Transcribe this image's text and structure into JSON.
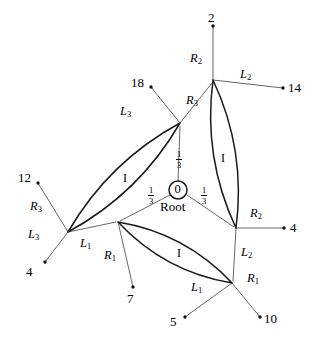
{
  "figure": {
    "type": "graph-diagram",
    "root": {
      "value": "0",
      "label": "Root",
      "cx": 178,
      "cy": 190,
      "r": 9
    },
    "weights": [
      {
        "text_top": "1",
        "text_bottom": "3",
        "x": 176,
        "y": 150,
        "name": "weight-up"
      },
      {
        "text_top": "1",
        "text_bottom": "3",
        "x": 148,
        "y": 186,
        "name": "weight-left"
      },
      {
        "text_top": "1",
        "text_bottom": "3",
        "x": 201,
        "y": 186,
        "name": "weight-right"
      }
    ],
    "nodes": [
      {
        "name": "node-upper-left",
        "x": 180,
        "y": 123
      },
      {
        "name": "node-left",
        "x": 68,
        "y": 232
      },
      {
        "name": "node-right-top",
        "x": 213,
        "y": 80
      },
      {
        "name": "node-right-bottom",
        "x": 236,
        "y": 228
      },
      {
        "name": "node-bottom-left",
        "x": 118,
        "y": 222
      },
      {
        "name": "node-bottom-right",
        "x": 232,
        "y": 283
      }
    ],
    "ellipses": [
      {
        "name": "ellipse-left",
        "x1": 68,
        "y1": 232,
        "x2": 180,
        "y2": 123,
        "bulge": 11,
        "label": "I",
        "label_x": 123,
        "label_y": 172
      },
      {
        "name": "ellipse-right",
        "x1": 213,
        "y1": 80,
        "x2": 236,
        "y2": 228,
        "bulge": 11,
        "label": "I",
        "label_x": 221,
        "label_y": 152
      },
      {
        "name": "ellipse-bottom",
        "x1": 118,
        "y1": 222,
        "x2": 232,
        "y2": 283,
        "bulge": 11,
        "label": "I",
        "label_x": 177,
        "label_y": 247
      }
    ],
    "spokes": [
      {
        "name": "spoke-root-to-upper-left",
        "x1": 178,
        "y1": 181,
        "x2": 180,
        "y2": 126
      },
      {
        "name": "spoke-root-to-bottom-left",
        "x1": 170,
        "y1": 195,
        "x2": 120,
        "y2": 221
      },
      {
        "name": "spoke-root-to-right-bottom",
        "x1": 187,
        "y1": 195,
        "x2": 234,
        "y2": 227
      }
    ],
    "branches": [
      {
        "name": "branch-18",
        "x1": 180,
        "y1": 123,
        "x2": 151,
        "y2": 87,
        "leaf": "18",
        "leaf_x": 131,
        "leaf_y": 76,
        "edge_label": "L",
        "edge_sub": "3",
        "edge_x": 120,
        "edge_y": 105
      },
      {
        "name": "branch-upper-left-to-right-top",
        "x1": 180,
        "y1": 123,
        "x2": 212,
        "y2": 83,
        "edge_label": "R",
        "edge_sub": "3",
        "edge_x": 186,
        "edge_y": 94
      },
      {
        "name": "branch-12",
        "x1": 68,
        "y1": 232,
        "x2": 38,
        "y2": 183,
        "leaf": "12",
        "leaf_x": 18,
        "leaf_y": 171,
        "edge_label": "R",
        "edge_sub": "3",
        "edge_x": 30,
        "edge_y": 200
      },
      {
        "name": "branch-4-left",
        "x1": 68,
        "y1": 232,
        "x2": 45,
        "y2": 262,
        "leaf": "4",
        "leaf_x": 26,
        "leaf_y": 265,
        "edge_label": "L",
        "edge_sub": "3",
        "edge_x": 28,
        "edge_y": 228
      },
      {
        "name": "branch-2",
        "x1": 213,
        "y1": 80,
        "x2": 213,
        "y2": 26,
        "leaf": "2",
        "leaf_x": 208,
        "leaf_y": 11,
        "edge_label": "R",
        "edge_sub": "2",
        "edge_x": 190,
        "edge_y": 52
      },
      {
        "name": "branch-14",
        "x1": 213,
        "y1": 80,
        "x2": 283,
        "y2": 88,
        "leaf": "14",
        "leaf_x": 288,
        "leaf_y": 81,
        "edge_label": "L",
        "edge_sub": "2",
        "edge_x": 240,
        "edge_y": 68
      },
      {
        "name": "branch-4-right",
        "x1": 236,
        "y1": 228,
        "x2": 284,
        "y2": 228,
        "leaf": "4",
        "leaf_x": 290,
        "leaf_y": 221,
        "edge_label": "R",
        "edge_sub": "2",
        "edge_x": 250,
        "edge_y": 207
      },
      {
        "name": "branch-right-bottom-to-bottom-right",
        "x1": 236,
        "y1": 228,
        "x2": 233,
        "y2": 281,
        "edge_label": "L",
        "edge_sub": "2",
        "edge_x": 241,
        "edge_y": 246
      },
      {
        "name": "branch-7",
        "x1": 118,
        "y1": 222,
        "x2": 133,
        "y2": 287,
        "leaf": "7",
        "leaf_x": 127,
        "leaf_y": 292,
        "edge_label": "R",
        "edge_sub": "1",
        "edge_x": 104,
        "edge_y": 249
      },
      {
        "name": "branch-left-to-bottom-left",
        "x1": 68,
        "y1": 232,
        "x2": 116,
        "y2": 222,
        "edge_label": "L",
        "edge_sub": "1",
        "edge_x": 80,
        "edge_y": 237
      },
      {
        "name": "branch-5",
        "x1": 232,
        "y1": 283,
        "x2": 185,
        "y2": 317,
        "leaf": "5",
        "leaf_x": 170,
        "leaf_y": 315,
        "edge_label": "L",
        "edge_sub": "1",
        "edge_x": 191,
        "edge_y": 281
      },
      {
        "name": "branch-10",
        "x1": 232,
        "y1": 283,
        "x2": 260,
        "y2": 317,
        "leaf": "10",
        "leaf_x": 264,
        "leaf_y": 312,
        "edge_label": "R",
        "edge_sub": "1",
        "edge_x": 247,
        "edge_y": 272
      }
    ],
    "colors": {
      "stroke": "#1a1a1a",
      "thin_stroke": "#555555",
      "background": "#ffffff"
    }
  }
}
